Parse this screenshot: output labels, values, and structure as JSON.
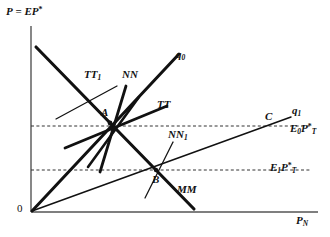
{
  "figure": {
    "type": "economics-diagram"
  },
  "axes": {
    "y_label_p": "P",
    "y_label_eq": " = ",
    "y_label_ep": "EP",
    "y_label_star": "*",
    "x_label_main": "P",
    "x_label_sub": "N",
    "origin_label": "0"
  },
  "curves": {
    "tt1": "TT",
    "tt1_sub": "1",
    "nn": "NN",
    "tt": "TT",
    "nn1": "NN",
    "nn1_sub": "1",
    "mm": "MM",
    "q0": "q",
    "q0_sub": "0",
    "q1": "q",
    "q1_sub": "1"
  },
  "points": {
    "a": "A",
    "b": "B",
    "c": "C"
  },
  "price_levels": {
    "e0": "E",
    "e0_sub": "0",
    "e0_p": "P",
    "e0_psub": "T",
    "e0_pstar": "*",
    "e1": "E",
    "e1_sub": "1",
    "e1_p": "P",
    "e1_psub": "T",
    "e1_pstar": "*"
  },
  "colors": {
    "line": "#111111",
    "axis": "#555555",
    "dash": "#333333",
    "background": "#ffffff"
  }
}
